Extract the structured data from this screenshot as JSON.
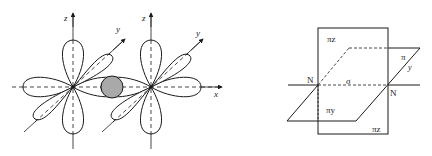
{
  "left_figure": {
    "description": "Two d-orbitals (four-lobed) side by side with p orbital overlap region shaded",
    "axes": {
      "left_orbital": {
        "z_label": "z",
        "y_label": "y"
      },
      "right_orbital": {
        "z_label": "z",
        "y_label": "y"
      },
      "x_label": "x"
    },
    "overlap_fill_color": "#a9a9a9"
  },
  "right_figure": {
    "description": "Bond planes between two N atoms",
    "labels": {
      "pi_z_top": "πz",
      "pi_z_bottom": "πz",
      "pi_right": "π",
      "y_label": "y",
      "sigma": "σ",
      "pi_y": "πy",
      "n_left": "N",
      "n_right": "N"
    }
  },
  "colors": {
    "line": "#1a1a1a",
    "background": "#ffffff"
  }
}
